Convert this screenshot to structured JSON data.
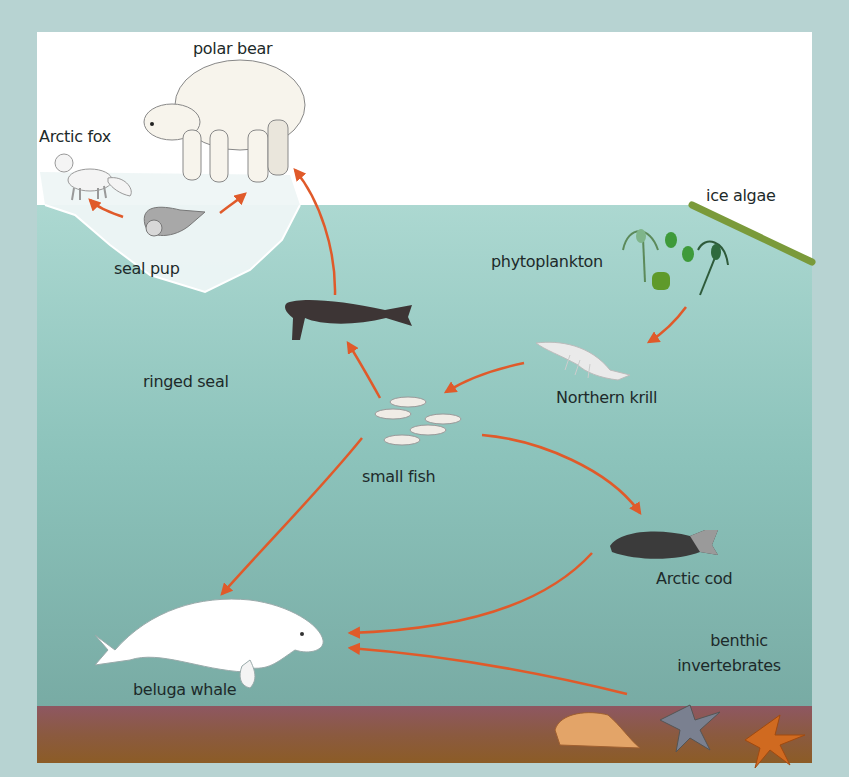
{
  "diagram": {
    "colors": {
      "frame": "#b7d3d2",
      "sky": "#ffffff",
      "water_top": "#a9d6cf",
      "water_bottom": "#74aea6",
      "seabed_top": "#8b5560",
      "seabed_bottom": "#8a5a2a",
      "arrow": "#e05a2a",
      "ice_algae": "#7a9a3a",
      "label_text": "#1d2a2a"
    },
    "organisms": [
      {
        "id": "polar-bear",
        "label": "polar bear"
      },
      {
        "id": "arctic-fox",
        "label": "Arctic fox"
      },
      {
        "id": "seal-pup",
        "label": "seal pup"
      },
      {
        "id": "ringed-seal",
        "label": "ringed seal"
      },
      {
        "id": "ice-algae",
        "label": "ice algae"
      },
      {
        "id": "phytoplankton",
        "label": "phytoplankton"
      },
      {
        "id": "northern-krill",
        "label": "Northern krill"
      },
      {
        "id": "small-fish",
        "label": "small fish"
      },
      {
        "id": "arctic-cod",
        "label": "Arctic cod"
      },
      {
        "id": "beluga-whale",
        "label": "beluga whale"
      },
      {
        "id": "benthic-invertebrates",
        "label_line1": "benthic",
        "label_line2": "invertebrates"
      }
    ],
    "edges": [
      {
        "from": "seal-pup",
        "to": "arctic-fox"
      },
      {
        "from": "seal-pup",
        "to": "polar-bear"
      },
      {
        "from": "ringed-seal",
        "to": "polar-bear"
      },
      {
        "from": "phytoplankton",
        "to": "northern-krill"
      },
      {
        "from": "northern-krill",
        "to": "small-fish"
      },
      {
        "from": "small-fish",
        "to": "ringed-seal"
      },
      {
        "from": "small-fish",
        "to": "arctic-cod"
      },
      {
        "from": "small-fish",
        "to": "beluga-whale"
      },
      {
        "from": "arctic-cod",
        "to": "beluga-whale"
      },
      {
        "from": "benthic-invertebrates",
        "to": "beluga-whale"
      }
    ]
  }
}
